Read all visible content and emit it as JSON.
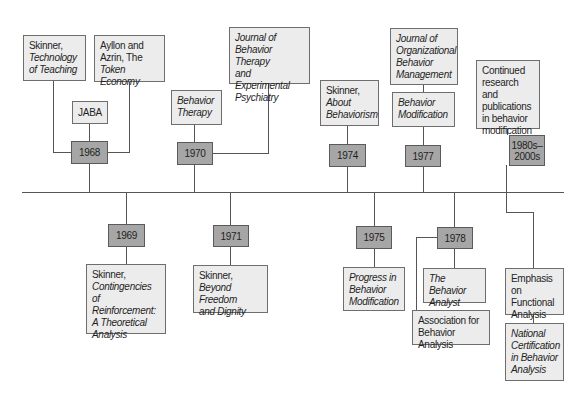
{
  "diagram": {
    "type": "timeline",
    "colors": {
      "event_box": "#ececec",
      "year_box": "#a6a6a6",
      "line": "#555555"
    },
    "above": [
      {
        "year": "1968",
        "events": [
          {
            "id": "skinner-tech",
            "lines": [
              {
                "t": "Skinner,",
                "i": false
              },
              {
                "t": "Technology",
                "i": true
              },
              {
                "t": "of Teaching",
                "i": true
              }
            ]
          },
          {
            "id": "ayllon",
            "lines": [
              {
                "t": "Ayllon and",
                "i": false
              },
              {
                "t": "Azrin, The",
                "i": false
              },
              {
                "t": "Token Economy",
                "i": true
              }
            ]
          },
          {
            "id": "jaba",
            "lines": [
              {
                "t": "JABA",
                "i": false
              }
            ]
          }
        ]
      },
      {
        "year": "1970",
        "events": [
          {
            "id": "behavior-therapy",
            "lines": [
              {
                "t": "Behavior",
                "i": true
              },
              {
                "t": "Therapy",
                "i": true
              }
            ]
          },
          {
            "id": "jbtep",
            "lines": [
              {
                "t": "Journal of",
                "i": true
              },
              {
                "t": "Behavior Therapy",
                "i": true
              },
              {
                "t": "and Experimental",
                "i": true
              },
              {
                "t": "Psychiatry",
                "i": true
              }
            ]
          }
        ]
      },
      {
        "year": "1974",
        "events": [
          {
            "id": "about-behaviorism",
            "lines": [
              {
                "t": "Skinner,",
                "i": false
              },
              {
                "t": "About",
                "i": true
              },
              {
                "t": "Behaviorism",
                "i": true
              }
            ]
          }
        ]
      },
      {
        "year": "1977",
        "events": [
          {
            "id": "jobm",
            "lines": [
              {
                "t": "Journal of",
                "i": true
              },
              {
                "t": "Organizational",
                "i": true
              },
              {
                "t": "Behavior",
                "i": true
              },
              {
                "t": "Management",
                "i": true
              }
            ]
          },
          {
            "id": "behavior-modification",
            "lines": [
              {
                "t": "Behavior",
                "i": true
              },
              {
                "t": "Modification",
                "i": true
              }
            ]
          }
        ]
      },
      {
        "year": "1980s–\n2000s",
        "year_lines": [
          "1980s–",
          "2000s"
        ],
        "events": [
          {
            "id": "continued",
            "lines": [
              {
                "t": "Continued",
                "i": false
              },
              {
                "t": "research and",
                "i": false
              },
              {
                "t": "publications",
                "i": false
              },
              {
                "t": "in behavior",
                "i": false
              },
              {
                "t": "modification",
                "i": false
              }
            ]
          }
        ]
      }
    ],
    "below": [
      {
        "year": "1969",
        "events": [
          {
            "id": "contingencies",
            "lines": [
              {
                "t": "Skinner,",
                "i": false
              },
              {
                "t": "Contingencies",
                "i": true
              },
              {
                "t": "of Reinforcement:",
                "i": true
              },
              {
                "t": "A Theoretical",
                "i": true
              },
              {
                "t": "Analysis",
                "i": true
              }
            ]
          }
        ]
      },
      {
        "year": "1971",
        "events": [
          {
            "id": "beyond-freedom",
            "lines": [
              {
                "t": "Skinner,",
                "i": false
              },
              {
                "t": "Beyond Freedom",
                "i": true
              },
              {
                "t": "and Dignity",
                "i": true
              }
            ]
          }
        ]
      },
      {
        "year": "1975",
        "events": [
          {
            "id": "progress",
            "lines": [
              {
                "t": "Progress in",
                "i": true
              },
              {
                "t": "Behavior",
                "i": true
              },
              {
                "t": "Modification",
                "i": true
              }
            ]
          }
        ]
      },
      {
        "year": "1978",
        "events": [
          {
            "id": "behavior-analyst",
            "lines": [
              {
                "t": "The Behavior",
                "i": true
              },
              {
                "t": "Analyst",
                "i": true
              }
            ]
          },
          {
            "id": "aba",
            "lines": [
              {
                "t": "Association for",
                "i": false
              },
              {
                "t": "Behavior Analysis",
                "i": false
              }
            ]
          }
        ]
      },
      {
        "year": "",
        "events": [
          {
            "id": "functional",
            "lines": [
              {
                "t": "Emphasis on",
                "i": false
              },
              {
                "t": "Functional",
                "i": false
              },
              {
                "t": "Analysis",
                "i": false
              }
            ]
          },
          {
            "id": "national-cert",
            "lines": [
              {
                "t": "National",
                "i": true
              },
              {
                "t": "Certification",
                "i": true
              },
              {
                "t": "in Behavior",
                "i": true
              },
              {
                "t": "Analysis",
                "i": true
              }
            ]
          }
        ]
      }
    ]
  },
  "boxes": {
    "skinner-tech": {
      "x": 23,
      "y": 35,
      "w": 63,
      "h": 46
    },
    "ayllon": {
      "x": 94,
      "y": 35,
      "w": 71,
      "h": 47
    },
    "jaba": {
      "x": 72,
      "y": 101,
      "w": 36,
      "h": 23
    },
    "behavior-therapy": {
      "x": 171,
      "y": 90,
      "w": 51,
      "h": 35
    },
    "jbtep": {
      "x": 229,
      "y": 27,
      "w": 81,
      "h": 57
    },
    "about-behaviorism": {
      "x": 320,
      "y": 80,
      "w": 59,
      "h": 46
    },
    "jobm": {
      "x": 390,
      "y": 28,
      "w": 68,
      "h": 57
    },
    "behavior-modification": {
      "x": 392,
      "y": 92,
      "w": 63,
      "h": 35
    },
    "continued": {
      "x": 476,
      "y": 60,
      "w": 64,
      "h": 69
    },
    "contingencies": {
      "x": 86,
      "y": 264,
      "w": 80,
      "h": 70
    },
    "beyond-freedom": {
      "x": 193,
      "y": 265,
      "w": 75,
      "h": 48
    },
    "progress": {
      "x": 343,
      "y": 267,
      "w": 62,
      "h": 44
    },
    "behavior-analyst": {
      "x": 423,
      "y": 268,
      "w": 63,
      "h": 35
    },
    "aba": {
      "x": 412,
      "y": 310,
      "w": 78,
      "h": 35
    },
    "functional": {
      "x": 505,
      "y": 268,
      "w": 59,
      "h": 47
    },
    "national-cert": {
      "x": 505,
      "y": 323,
      "w": 59,
      "h": 58
    }
  }
}
